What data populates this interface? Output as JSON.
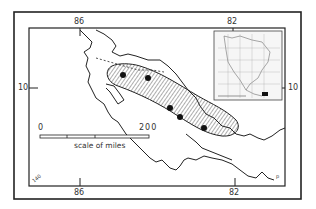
{
  "map": {
    "longitude_ticks": {
      "top": [
        "86",
        "82"
      ],
      "bottom": [
        "86",
        "82"
      ]
    },
    "latitude_ticks": {
      "left": "10",
      "right": "10"
    },
    "scale": {
      "start": "0",
      "end": "200",
      "label": "scale of miles"
    },
    "corner_labels": {
      "bottom_left": "140",
      "bottom_right": "p"
    },
    "range_shading": "hatched",
    "locality_points": 5,
    "inset": {
      "labels": [
        "40",
        "40",
        "120",
        "100",
        "80"
      ]
    },
    "colors": {
      "ink": "#222222",
      "background": "#ffffff"
    }
  }
}
